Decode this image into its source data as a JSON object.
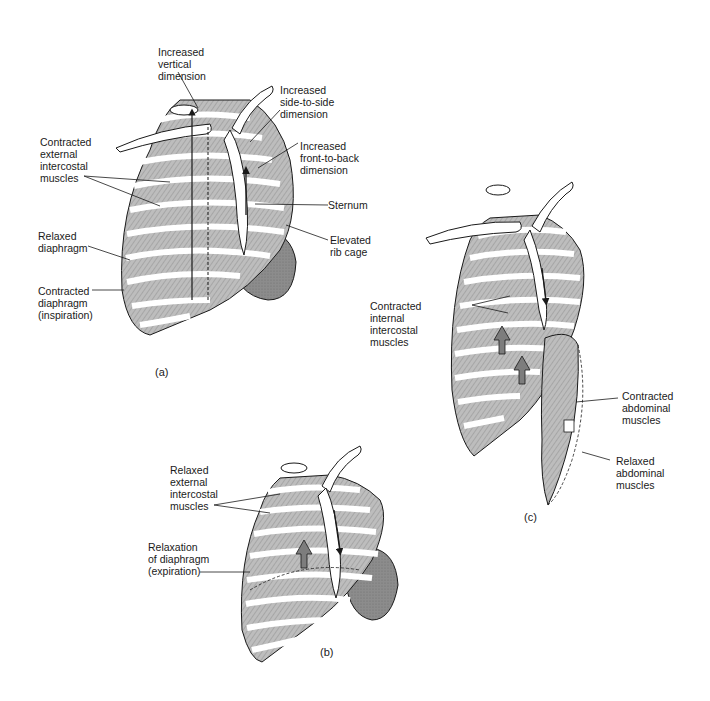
{
  "figure": {
    "colors": {
      "background": "#ffffff",
      "ink": "#1a1a1a",
      "muscle": "#b9b9b9",
      "muscle_dark": "#8e8e8e",
      "bone": "#ffffff",
      "diaphragm": "#8a8a8a",
      "arrow_fill": "#7d7d7d"
    },
    "panels": [
      {
        "id": "a",
        "caption": "(a)",
        "labels": {
          "vertical": "Increased\nvertical\ndimension",
          "side": "Increased\nside-to-side\ndimension",
          "front": "Increased\nfront-to-back\ndimension",
          "external": "Contracted\nexternal\nintercostal\nmuscles",
          "sternum": "Sternum",
          "elevated": "Elevated\nrib cage",
          "relaxed_diaphragm": "Relaxed\ndiaphragm",
          "contracted_diaphragm": "Contracted\ndiaphragm\n(inspiration)"
        }
      },
      {
        "id": "b",
        "caption": "(b)",
        "labels": {
          "relaxed_external": "Relaxed\nexternal\nintercostal\nmuscles",
          "relaxation": "Relaxation\nof diaphragm\n(expiration)"
        }
      },
      {
        "id": "c",
        "caption": "(c)",
        "labels": {
          "internal": "Contracted\ninternal\nintercostal\nmuscles",
          "contracted_abdominal": "Contracted\nabdominal\nmuscles",
          "relaxed_abdominal": "Relaxed\nabdominal\nmuscles"
        }
      }
    ]
  }
}
